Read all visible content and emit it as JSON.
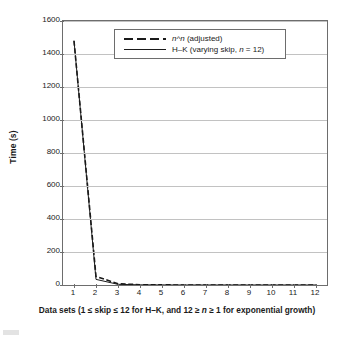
{
  "chart_data": {
    "type": "line",
    "title": "",
    "xlabel": "Data sets (1 ≤ skip ≤ 12 for H–K, and 12 ≥ n ≥ 1 for exponential growth)",
    "ylabel": "Time (s)",
    "xlim": [
      0.5,
      12.5
    ],
    "ylim": [
      0,
      1600
    ],
    "grid": true,
    "legend_position": "top-center",
    "x": [
      1,
      2,
      3,
      4,
      5,
      6,
      7,
      8,
      9,
      10,
      11,
      12
    ],
    "xticks": [
      "1",
      "2",
      "3",
      "4",
      "5",
      "6",
      "7",
      "8",
      "9",
      "10",
      "11",
      "12"
    ],
    "yticks": [
      "0",
      "200",
      "400",
      "600",
      "800",
      "1000",
      "1200",
      "1400",
      "1600"
    ],
    "series": [
      {
        "name": "n^n (adjusted)",
        "style": "dashed",
        "color": "#1a1a1a",
        "values": [
          1480,
          52,
          8,
          1.5,
          0.6,
          0.3,
          0.2,
          0.15,
          0.1,
          0.08,
          0.06,
          0.05
        ]
      },
      {
        "name": "H–K (varying skip, n = 12)",
        "style": "solid",
        "color": "#1a1a1a",
        "values": [
          1480,
          34,
          4,
          1.0,
          0.4,
          0.2,
          0.15,
          0.1,
          0.08,
          0.06,
          0.05,
          0.04
        ]
      }
    ]
  },
  "legend": {
    "entries": [
      {
        "label_pre": "n",
        "label_sup": "^n",
        "label_rest": " (adjusted)",
        "full": "n^n (adjusted)"
      },
      {
        "label_pre": "H–K (varying skip, ",
        "label_sup": "n",
        "label_rest": " = 12)",
        "full": "H–K (varying skip, n = 12)"
      }
    ]
  },
  "axis_titles": {
    "x_part1": "Data sets (1 ≤ skip ≤ 12 for H–K, and 12 ≥ ",
    "x_italic": "n",
    "x_part2": " ≥ 1 for exponential growth)",
    "y": "Time (s)"
  }
}
